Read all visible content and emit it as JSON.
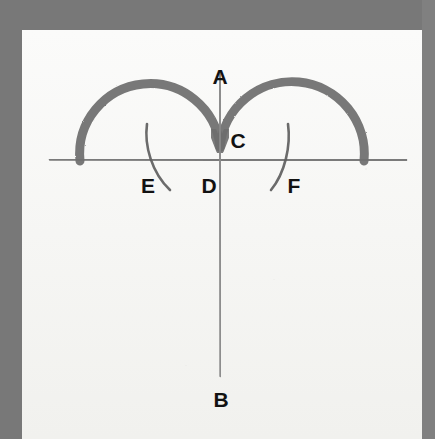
{
  "document": {
    "kind": "scanned-geometry-figure",
    "frame_color": "#787878",
    "paper_color": "#f7f7f5"
  },
  "figure": {
    "title": "",
    "stroke_colors": {
      "thick_arc": "#6e6e6e",
      "baseline": "#6f6f6f",
      "axis_line": "#858585",
      "thin_arc": "#5f5f5f"
    },
    "labels": [
      {
        "id": "A",
        "text": "A",
        "x": 220,
        "y": 66
      },
      {
        "id": "C",
        "text": "C",
        "x": 238,
        "y": 130
      },
      {
        "id": "E",
        "text": "E",
        "x": 148,
        "y": 175
      },
      {
        "id": "D",
        "text": "D",
        "x": 209,
        "y": 175
      },
      {
        "id": "F",
        "text": "F",
        "x": 294,
        "y": 175
      },
      {
        "id": "B",
        "text": "B",
        "x": 221,
        "y": 389
      }
    ],
    "elements": {
      "baseline": {
        "name": "horizontal-baseline",
        "x1": 50,
        "y1": 159,
        "x2": 406,
        "y2": 160
      },
      "vertical": {
        "name": "vertical-axis",
        "x1": 220,
        "y1": 72,
        "x2": 220,
        "y2": 376
      },
      "arc_left": {
        "name": "left-semicircular-arc",
        "cx": 150,
        "cy": 160,
        "r": 70
      },
      "arc_right": {
        "name": "right-semicircular-arc",
        "cx": 292,
        "cy": 160,
        "r": 72
      },
      "thin_arc_e": {
        "name": "thin-arc-e",
        "from_x": 147,
        "from_y": 124,
        "to_x": 170,
        "to_y": 190
      },
      "thin_arc_f": {
        "name": "thin-arc-f",
        "from_x": 288,
        "from_y": 124,
        "to_x": 271,
        "to_y": 190
      }
    }
  }
}
